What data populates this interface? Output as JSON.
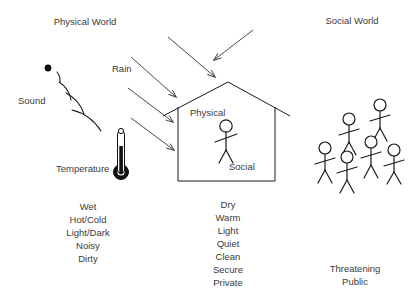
{
  "diagram": {
    "headings": {
      "physical_world": "Physical World",
      "social_world": "Social World"
    },
    "stimuli_labels": {
      "sound": "Sound",
      "rain": "Rain",
      "temperature": "Temperature"
    },
    "house_labels": {
      "physical": "Physical",
      "social": "Social"
    },
    "outside_attributes": [
      "Wet",
      "Hot/Cold",
      "Light/Dark",
      "Noisy",
      "Dirty"
    ],
    "inside_attributes": [
      "Dry",
      "Warm",
      "Light",
      "Quiet",
      "Clean",
      "Secure",
      "Private"
    ],
    "social_attributes": [
      "Threatening",
      "Public"
    ],
    "icons": {
      "sound_source": "sound-source-dot",
      "sound_waves": "sound-wave-arcs",
      "thermometer": "thermometer-icon",
      "rain_arrows": "rain-arrow",
      "house": "house-outline",
      "person": "stick-figure"
    },
    "colors": {
      "background": "#ffffff",
      "stroke": "#1a1a1a",
      "arrow": "#4a4a4a",
      "text": "#3a3a3a"
    },
    "counts": {
      "rain_arrows": 5,
      "sound_arcs": 4,
      "social_figures": 6,
      "house_figures": 1
    }
  }
}
